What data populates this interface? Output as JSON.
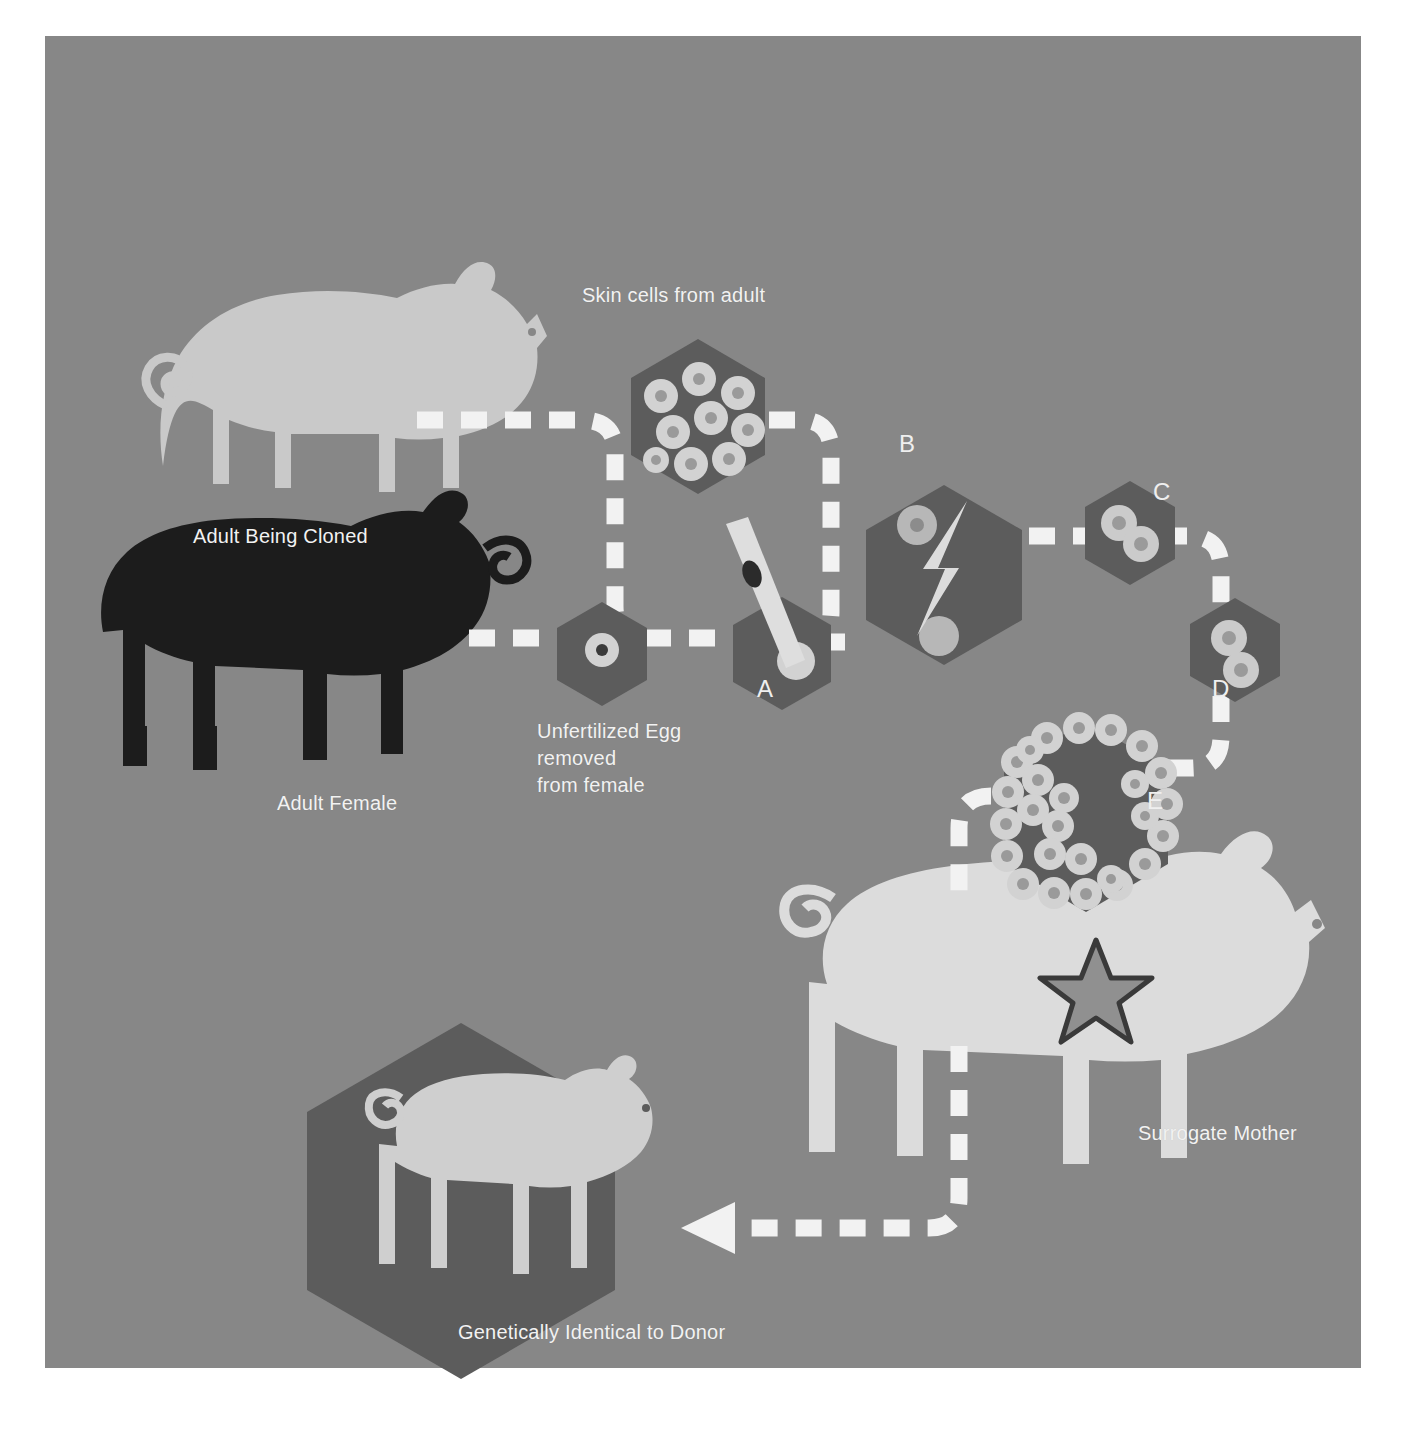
{
  "diagram": {
    "background_color": "#878787",
    "canvas": {
      "x": 45,
      "y": 36,
      "width": 1316,
      "height": 1332
    },
    "palette": {
      "background": "#878787",
      "hexagon_dark": "#5c5c5c",
      "hexagon_mid": "#666666",
      "pig_light": "#c9c9c9",
      "pig_dark": "#1c1c1c",
      "pig_surrogate": "#dcdcdc",
      "piglet": "#cfcfcf",
      "cell_fill": "#d2d2d2",
      "cell_nucleus": "#9a9a9a",
      "arrow_white": "#f2f2f2",
      "text": "#f0f0f0",
      "star_fill": "#909090",
      "star_stroke": "#3a3a3a",
      "pipette": "#dedede",
      "nucleus_dark": "#2b2b2b"
    }
  },
  "labels": [
    {
      "id": "skin-cells",
      "text": "Skin cells from adult",
      "x": 537,
      "y": 246,
      "align": "left"
    },
    {
      "id": "adult-cloned",
      "text": "Adult Being Cloned",
      "x": 148,
      "y": 487,
      "align": "left"
    },
    {
      "id": "unfertilized",
      "text": "Unfertilized Egg\nremoved\nfrom female",
      "x": 492,
      "y": 682,
      "align": "left"
    },
    {
      "id": "adult-female",
      "text": "Adult Female",
      "x": 232,
      "y": 754,
      "align": "left"
    },
    {
      "id": "surrogate",
      "text": "Surrogate Mother",
      "x": 1093,
      "y": 1084,
      "align": "left"
    },
    {
      "id": "genetically",
      "text": "Genetically Identical to Donor",
      "x": 413,
      "y": 1283,
      "align": "left"
    }
  ],
  "steps": [
    {
      "id": "A",
      "letter": "A",
      "x": 712,
      "y": 640,
      "description": "Nucleus from skin cell inserted into enucleated egg"
    },
    {
      "id": "B",
      "letter": "B",
      "x": 854,
      "y": 395,
      "description": "Electric pulse fuses cell and egg"
    },
    {
      "id": "C",
      "letter": "C",
      "x": 1108,
      "y": 443,
      "description": "Two-cell stage division"
    },
    {
      "id": "D",
      "letter": "D",
      "x": 1167,
      "y": 640,
      "description": "Further cell division"
    },
    {
      "id": "E",
      "letter": "E",
      "x": 1102,
      "y": 752,
      "description": "Blastocyst implanted into surrogate"
    }
  ],
  "nodes": [
    {
      "id": "skin-cell-cluster",
      "name": "skin-cells-hexagon",
      "cx": 653,
      "cy": 380,
      "r": 77,
      "cells": 9
    },
    {
      "id": "egg-hex",
      "name": "unfertilized-egg-hexagon",
      "cx": 557,
      "cy": 621,
      "r": 52,
      "cells": 1
    },
    {
      "id": "transfer-hex",
      "name": "nuclear-transfer-hexagon",
      "cx": 737,
      "cy": 621,
      "r": 57,
      "cells": 1
    },
    {
      "id": "fusion-hex",
      "name": "electric-fusion-hexagon",
      "cx": 899,
      "cy": 535,
      "r": 90,
      "cells": 2
    },
    {
      "id": "two-cell-hex",
      "name": "two-cell-stage-hexagon",
      "cx": 1085,
      "cy": 500,
      "r": 52,
      "cells": 2
    },
    {
      "id": "four-cell-hex",
      "name": "four-cell-stage-hexagon",
      "cx": 1190,
      "cy": 617,
      "r": 52,
      "cells": 2
    },
    {
      "id": "blastocyst-hex",
      "name": "blastocyst-hexagon",
      "cx": 1041,
      "cy": 780,
      "r": 95,
      "cells": 26
    },
    {
      "id": "clone-hex",
      "name": "clone-result-hexagon",
      "cx": 416,
      "cy": 1165,
      "r": 178,
      "cells": 0
    }
  ],
  "animals": [
    {
      "id": "donor",
      "name": "adult-pig-being-cloned",
      "color": "#c9c9c9"
    },
    {
      "id": "female",
      "name": "adult-female-pig",
      "color": "#1c1c1c"
    },
    {
      "id": "surrogate",
      "name": "surrogate-mother-pig",
      "color": "#dcdcdc"
    },
    {
      "id": "piglet",
      "name": "cloned-piglet",
      "color": "#cfcfcf"
    }
  ],
  "icons": {
    "lightning": "lightning-bolt-icon",
    "star": "star-icon",
    "pipette": "pipette-icon",
    "arrow": "arrow-head-icon"
  }
}
